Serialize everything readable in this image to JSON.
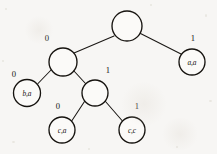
{
  "figure": {
    "type": "binary-tree-diagram",
    "width": 217,
    "height": 154,
    "background_color": "#f7f6f4",
    "stroke_color": "#16130f"
  },
  "tree": {
    "nodes": [
      {
        "id": "root",
        "label": "",
        "cx": 127,
        "cy": 26,
        "r": 15,
        "kind": "internal"
      },
      {
        "id": "n-left",
        "label": "",
        "cx": 63,
        "cy": 62,
        "r": 14,
        "kind": "internal"
      },
      {
        "id": "leaf-aa",
        "label": "a,a",
        "cx": 192,
        "cy": 62,
        "r": 13,
        "kind": "leaf"
      },
      {
        "id": "leaf-ba",
        "label": "b,a",
        "cx": 27,
        "cy": 93,
        "r": 13.5,
        "kind": "leaf"
      },
      {
        "id": "n-mid",
        "label": "",
        "cx": 95,
        "cy": 93,
        "r": 13,
        "kind": "internal"
      },
      {
        "id": "leaf-ca",
        "label": "c,a",
        "cx": 62,
        "cy": 130,
        "r": 13,
        "kind": "leaf"
      },
      {
        "id": "leaf-cc",
        "label": "c,c",
        "cx": 132,
        "cy": 130,
        "r": 13,
        "kind": "leaf"
      }
    ],
    "edges": [
      {
        "id": "e-root-left",
        "from": "root",
        "to": "n-left",
        "label": "0",
        "lx": 47,
        "ly": 38
      },
      {
        "id": "e-root-right",
        "from": "root",
        "to": "leaf-aa",
        "label": "1",
        "lx": 193,
        "ly": 38
      },
      {
        "id": "e-left-ba",
        "from": "n-left",
        "to": "leaf-ba",
        "label": "0",
        "lx": 14,
        "ly": 74
      },
      {
        "id": "e-left-mid",
        "from": "n-left",
        "to": "n-mid",
        "label": "1",
        "lx": 108,
        "ly": 70
      },
      {
        "id": "e-mid-ca",
        "from": "n-mid",
        "to": "leaf-ca",
        "label": "0",
        "lx": 58,
        "ly": 106
      },
      {
        "id": "e-mid-cc",
        "from": "n-mid",
        "to": "leaf-cc",
        "label": "1",
        "lx": 137,
        "ly": 106
      }
    ]
  },
  "artifacts": {
    "specks": [
      {
        "x": 5,
        "y": 8,
        "w": 2,
        "h": 2
      },
      {
        "x": 205,
        "y": 14,
        "w": 2,
        "h": 3
      },
      {
        "x": 12,
        "y": 141,
        "w": 3,
        "h": 2
      },
      {
        "x": 176,
        "y": 146,
        "w": 2,
        "h": 2
      },
      {
        "x": 88,
        "y": 148,
        "w": 2,
        "h": 2
      },
      {
        "x": 209,
        "y": 100,
        "w": 3,
        "h": 2
      },
      {
        "x": 2,
        "y": 60,
        "w": 2,
        "h": 2
      },
      {
        "x": 150,
        "y": 4,
        "w": 2,
        "h": 2
      }
    ],
    "smudges": [
      {
        "x": 120,
        "y": 82,
        "w": 48,
        "h": 44
      },
      {
        "x": 24,
        "y": 16,
        "w": 30,
        "h": 28
      },
      {
        "x": 160,
        "y": 118,
        "w": 40,
        "h": 32
      }
    ]
  }
}
